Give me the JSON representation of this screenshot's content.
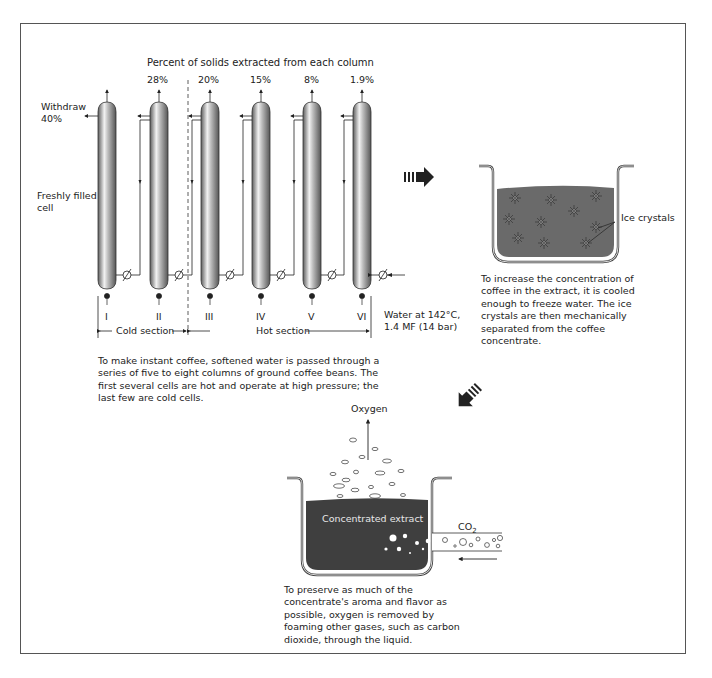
{
  "diagram": {
    "title": "Percent of solids extracted from each column",
    "withdraw_label": "Withdraw",
    "withdraw_percent": "40%",
    "fresh_label_line1": "Freshly filled",
    "fresh_label_line2": "cell",
    "columns": [
      {
        "numeral": "I",
        "percent": ""
      },
      {
        "numeral": "II",
        "percent": "28%"
      },
      {
        "numeral": "III",
        "percent": "20%"
      },
      {
        "numeral": "IV",
        "percent": "15%"
      },
      {
        "numeral": "V",
        "percent": "8%"
      },
      {
        "numeral": "VI",
        "percent": "1.9%"
      }
    ],
    "water_line1": "Water at 142°C,",
    "water_line2": "1.4 MF (14 bar)",
    "cold_section": "Cold section",
    "hot_section": "Hot section",
    "extraction_caption": "To make instant coffee, softened water is passed through a series of five to eight columns of ground coffee beans. The first several cells are hot and operate at high pressure; the last few are cold cells.",
    "ice_label": "Ice crystals",
    "freeze_caption": "To increase the concentration of coffee in the extract, it is cooled enough to freeze water. The ice crystals are then mechanically separated from the coffee concentrate.",
    "oxygen_label": "Oxygen",
    "extract_label": "Concentrated extract",
    "co2_label": "CO",
    "co2_sub": "2",
    "foam_caption": "To preserve as much of the concentrate's aroma and flavor as possible, oxygen is removed by foaming other gases, such as carbon dioxide, through the liquid.",
    "colors": {
      "liquid": "#5e5e5e",
      "dark_liquid": "#3f3f3f",
      "column_dark": "#6a6a6a",
      "column_light": "#e8e8e8",
      "frame": "#555555"
    }
  }
}
